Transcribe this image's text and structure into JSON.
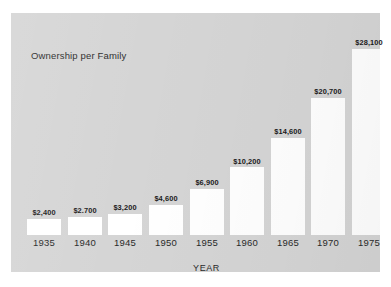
{
  "chart_data": {
    "type": "bar",
    "title": "Ownership per Family",
    "xlabel": "YEAR",
    "ylabel": "",
    "categories": [
      "1935",
      "1940",
      "1945",
      "1950",
      "1955",
      "1960",
      "1965",
      "1970",
      "1975"
    ],
    "values": [
      2400,
      2700,
      3200,
      4600,
      6900,
      10200,
      14600,
      20700,
      28100
    ],
    "value_labels": [
      "$2,400",
      "$2.700",
      "$3,200",
      "$4,600",
      "$6,900",
      "$10,200",
      "$14,600",
      "$20,700",
      "$28,100"
    ],
    "ylim": [
      0,
      28100
    ],
    "grid": false,
    "legend": false,
    "bar_color": "#ffffff",
    "panel_color": "#d5d5d5",
    "text_color": "#1a1a1a"
  },
  "chart": {
    "title": "Ownership per Family",
    "axis_label_x": "YEAR"
  }
}
